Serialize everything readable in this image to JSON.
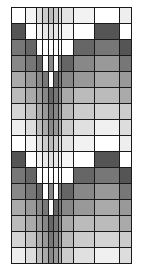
{
  "diagram": {
    "type": "grayscale-grid",
    "origin": [
      11,
      7
    ],
    "column_edges": [
      0,
      14,
      25,
      31,
      37,
      42,
      47,
      50,
      62,
      83,
      108,
      120
    ],
    "row_height": 16,
    "row_count": 16,
    "border_color": "#1a1a1a",
    "pattern_rows": [
      [
        "#ffffff",
        "#f4f4f4",
        "#dddddd",
        "#cccccc",
        "#bbbbbb",
        "#cccccc",
        "#dddddd",
        "#e4e4e4",
        "#f2f2f2",
        "#ffffff",
        "#eeeeee"
      ],
      [
        "#555555",
        "#ffffff",
        "#f2f2f2",
        "#e8e8e8",
        "#dddddd",
        "#e8e8e8",
        "#f0f0f0",
        "#f6f6f6",
        "#ffffff",
        "#555555",
        "#ffffff"
      ],
      [
        "#777777",
        "#666666",
        "#ffffff",
        "#ffffff",
        "#ffffff",
        "#ffffff",
        "#ffffff",
        "#ffffff",
        "#666666",
        "#777777",
        "#555555"
      ],
      [
        "#888888",
        "#777777",
        "#666666",
        "#ffffff",
        "#888888",
        "#ffffff",
        "#777777",
        "#666666",
        "#888888",
        "#999999",
        "#777777"
      ],
      [
        "#aaaaaa",
        "#999999",
        "#888888",
        "#777777",
        "#ffffff",
        "#666666",
        "#777777",
        "#888888",
        "#999999",
        "#aaaaaa",
        "#999999"
      ],
      [
        "#bbbbbb",
        "#aaaaaa",
        "#999999",
        "#888888",
        "#666666",
        "#777777",
        "#888888",
        "#aaaaaa",
        "#bbbbbb",
        "#bbbbbb",
        "#aaaaaa"
      ],
      [
        "#d4d4d4",
        "#c4c4c4",
        "#aaaaaa",
        "#999999",
        "#777777",
        "#888888",
        "#999999",
        "#bbbbbb",
        "#cccccc",
        "#d4d4d4",
        "#cccccc"
      ],
      [
        "#eeeeee",
        "#dddddd",
        "#bbbbbb",
        "#aaaaaa",
        "#888888",
        "#999999",
        "#aaaaaa",
        "#cccccc",
        "#e0e0e0",
        "#f0f0f0",
        "#dddddd"
      ]
    ],
    "repeat_count": 2
  }
}
